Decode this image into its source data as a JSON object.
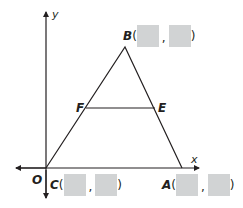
{
  "figure": {
    "axes": {
      "x_label": "x",
      "y_label": "y",
      "origin_label": "O"
    },
    "points": {
      "B": {
        "name": "B",
        "open": "(",
        "comma": ",",
        "close": ")",
        "x_value": "",
        "y_value": ""
      },
      "C": {
        "name": "C",
        "open": "(",
        "comma": ",",
        "close": ")",
        "x_value": "",
        "y_value": ""
      },
      "A": {
        "name": "A",
        "open": "(",
        "comma": ",",
        "close": ")",
        "x_value": "",
        "y_value": ""
      },
      "F": {
        "name": "F"
      },
      "E": {
        "name": "E"
      }
    },
    "colors": {
      "line": "#231f20",
      "answer_box": "#d1d3d4"
    }
  }
}
